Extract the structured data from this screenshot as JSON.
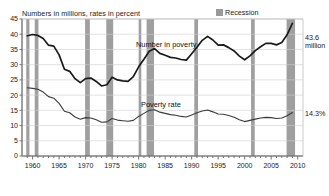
{
  "subtitle": "Numbers in millions, rates in percent",
  "legend": {
    "recession_label": "Recession",
    "recession_color": "#9a9a9a"
  },
  "annotations": {
    "number_end_line1": "43.6",
    "number_end_line2": "million",
    "rate_end": "14.3%",
    "number_series_label": "Number in poverty",
    "rate_series_label": "Poverty rate"
  },
  "chart_data": {
    "type": "line",
    "title": "",
    "subtitle": "Numbers in millions, rates in percent",
    "xlabel": "",
    "ylabel": "",
    "xlim": [
      1958,
      2011
    ],
    "ylim": [
      0,
      45
    ],
    "grid": true,
    "legend_position": "top-right",
    "y_ticks": [
      0,
      5,
      10,
      15,
      20,
      25,
      30,
      35,
      40,
      45
    ],
    "x_ticks": [
      1960,
      1965,
      1970,
      1975,
      1980,
      1985,
      1990,
      1995,
      2000,
      2005,
      2010
    ],
    "x_minor_tick_step": 1,
    "x": [
      1959,
      1960,
      1961,
      1962,
      1963,
      1964,
      1965,
      1966,
      1967,
      1968,
      1969,
      1970,
      1971,
      1972,
      1973,
      1974,
      1975,
      1976,
      1977,
      1978,
      1979,
      1980,
      1981,
      1982,
      1983,
      1984,
      1985,
      1986,
      1987,
      1988,
      1989,
      1990,
      1991,
      1992,
      1993,
      1994,
      1995,
      1996,
      1997,
      1998,
      1999,
      2000,
      2001,
      2002,
      2003,
      2004,
      2005,
      2006,
      2007,
      2008,
      2009
    ],
    "series": [
      {
        "name": "Number in poverty",
        "units": "millions",
        "color": "#1a1a1a",
        "end_label": "43.6 million",
        "values": [
          39.5,
          39.9,
          39.6,
          38.6,
          36.4,
          36.1,
          33.2,
          28.5,
          27.8,
          25.4,
          24.1,
          25.4,
          25.6,
          24.5,
          23.0,
          23.4,
          25.9,
          25.0,
          24.7,
          24.5,
          26.1,
          29.3,
          31.8,
          34.4,
          35.3,
          33.7,
          33.1,
          32.4,
          32.2,
          31.7,
          31.5,
          33.6,
          35.7,
          38.0,
          39.3,
          38.1,
          36.4,
          36.5,
          35.6,
          34.5,
          32.8,
          31.6,
          32.9,
          34.6,
          35.9,
          37.0,
          37.0,
          36.5,
          37.3,
          39.8,
          43.6
        ]
      },
      {
        "name": "Poverty rate",
        "units": "percent",
        "color": "#3a3a3a",
        "end_label": "14.3%",
        "values": [
          22.4,
          22.2,
          21.9,
          21.0,
          19.5,
          19.0,
          17.3,
          14.7,
          14.2,
          12.8,
          12.1,
          12.6,
          12.5,
          11.9,
          11.1,
          11.2,
          12.3,
          11.8,
          11.6,
          11.4,
          11.7,
          13.0,
          14.0,
          15.0,
          15.2,
          14.4,
          14.0,
          13.6,
          13.4,
          13.0,
          12.8,
          13.5,
          14.2,
          14.8,
          15.1,
          14.5,
          13.8,
          13.7,
          13.3,
          12.7,
          11.9,
          11.3,
          11.7,
          12.1,
          12.5,
          12.7,
          12.6,
          12.3,
          12.5,
          13.2,
          14.3
        ]
      }
    ],
    "recession_bands": [
      {
        "start": 1958.8,
        "end": 1959.4
      },
      {
        "start": 1960.4,
        "end": 1961.1
      },
      {
        "start": 1969.9,
        "end": 1970.8
      },
      {
        "start": 1973.9,
        "end": 1975.2
      },
      {
        "start": 1980.0,
        "end": 1980.5
      },
      {
        "start": 1981.5,
        "end": 1982.9
      },
      {
        "start": 1990.5,
        "end": 1991.2
      },
      {
        "start": 2001.2,
        "end": 2001.9
      },
      {
        "start": 2007.9,
        "end": 2009.5
      }
    ]
  }
}
